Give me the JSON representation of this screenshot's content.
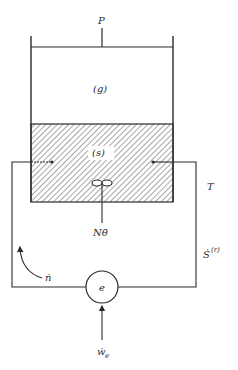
{
  "diagram": {
    "title": "",
    "colors": {
      "line": "#2a2a2a",
      "hatch": "#6a6a6a",
      "background": "#ffffff"
    },
    "labels": {
      "pressure": "P",
      "gas_phase": "(g)",
      "solid_phase": "(s)",
      "stirrer_work": "Nθ̇",
      "temperature": "T",
      "entropy_rate_base": "Ṡ",
      "entropy_rate_sup": "(r)",
      "molar_flow": "ṅ",
      "electrochem_cell": "e",
      "electric_work_base": "ẇ",
      "electric_work_sub": "e"
    },
    "components": [
      {
        "id": "cylinder",
        "description": "vessel with piston"
      },
      {
        "id": "piston",
        "description": "piston with rod, pressure P"
      },
      {
        "id": "gas-region",
        "description": "gas phase (g)"
      },
      {
        "id": "solid-region",
        "description": "hatched solid phase (s)"
      },
      {
        "id": "stirrer",
        "description": "paddle stirrer with shaft"
      },
      {
        "id": "electrodes",
        "description": "left and right electrodes"
      },
      {
        "id": "external-circuit",
        "description": "wire loop through cell e"
      },
      {
        "id": "cell",
        "description": "circle labeled e"
      }
    ]
  }
}
